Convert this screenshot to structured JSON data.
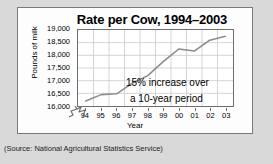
{
  "chart_data": {
    "type": "line",
    "title": "Rate per Cow, 1994–2003",
    "xlabel": "Year",
    "ylabel": "Pounds of milk",
    "categories": [
      "94",
      "95",
      "96",
      "97",
      "98",
      "99",
      "00",
      "01",
      "02",
      "03"
    ],
    "values": [
      16200,
      16450,
      16480,
      16900,
      17200,
      17750,
      18250,
      18170,
      18600,
      18750
    ],
    "series": [
      {
        "name": "Pounds of milk per cow",
        "values": [
          16200,
          16450,
          16480,
          16900,
          17200,
          17750,
          18250,
          18170,
          18600,
          18750
        ]
      }
    ],
    "ylim": [
      16000,
      19000
    ],
    "ytick_labels": [
      "19,000",
      "18,500",
      "18,000",
      "17,500",
      "17,000",
      "16,500",
      "16,000"
    ],
    "ytick_values": [
      19000,
      18500,
      18000,
      17500,
      17000,
      16500,
      16000
    ],
    "xtick_labels": [
      "94",
      "95",
      "96",
      "97",
      "98",
      "99",
      "00",
      "01",
      "02",
      "03"
    ],
    "grid": true,
    "legend": "none",
    "y_axis_break": true,
    "annotations": [
      {
        "text": "15% increase over"
      },
      {
        "text": "a 10-year period"
      }
    ],
    "line_color": "#8c8c8c",
    "grid_color": "#c9c9c9",
    "frame_color": "#6d6d6d"
  },
  "source": {
    "text": "(Source:  National Agricultural Statistics Service)"
  }
}
